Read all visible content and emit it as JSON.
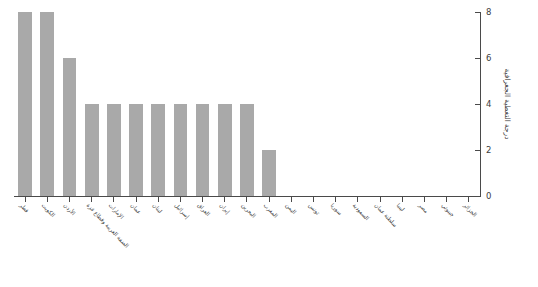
{
  "chart_data": {
    "type": "bar",
    "title": "",
    "xlabel": "",
    "ylabel": "درجة التغطية الجغرافية",
    "ylim": [
      0,
      8
    ],
    "yticks": [
      0,
      2,
      4,
      6,
      8
    ],
    "grid": false,
    "legend": false,
    "bar_color": "#a9a9a9",
    "axis_color": "#4a4a4a",
    "direction": "rtl",
    "categories": [
      "قطر",
      "الكويت",
      "الأردن",
      "الضفة الغربية وقطاع غزة",
      "الإمارات",
      "عمان",
      "لبنان",
      "إسرائيل",
      "العراق",
      "إيران",
      "البحرين",
      "المغرب",
      "اليمن",
      "تونس",
      "سوريا",
      "السعودية",
      "سلطنة عمان",
      "ليبيا",
      "مصر",
      "جيبوتي",
      "الجزائر"
    ],
    "values": [
      8,
      8,
      6,
      4,
      4,
      4,
      4,
      4,
      4,
      4,
      4,
      2,
      0,
      0,
      0,
      0,
      0,
      0,
      0,
      0,
      0
    ]
  }
}
